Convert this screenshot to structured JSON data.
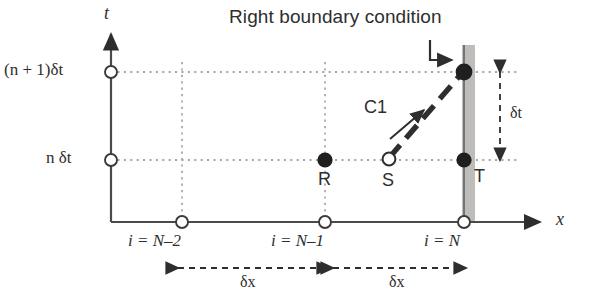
{
  "figure": {
    "title": "Right boundary condition",
    "axes": {
      "y_name": "t",
      "x_name": "x",
      "y_ticks": [
        {
          "id": "t-upper",
          "label_prefix": "(n + 1)",
          "label_unit": "δt",
          "label_full": "(n + 1)δt"
        },
        {
          "id": "t-lower",
          "label_prefix": "n",
          "label_unit": "δt",
          "label_full": "n δt"
        }
      ],
      "x_ticks": [
        {
          "id": "x-n-minus-2",
          "label": "i = N–2"
        },
        {
          "id": "x-n-minus-1",
          "label": "i = N–1"
        },
        {
          "id": "x-n",
          "label": "i = N"
        }
      ]
    },
    "nodes": [
      {
        "id": "R",
        "label": "R",
        "fill": "solid"
      },
      {
        "id": "S",
        "label": "S",
        "fill": "open"
      },
      {
        "id": "T",
        "label": "T",
        "fill": "solid"
      }
    ],
    "characteristic": {
      "label": "C1"
    },
    "spacing": {
      "dx_left": "δx",
      "dx_right": "δx",
      "dt": "δt"
    },
    "colors": {
      "ink": "#2e2e2e",
      "grid": "#9a9a9a",
      "boundary_band": "#b4b2ad",
      "axis": "#4a4a4a"
    }
  }
}
